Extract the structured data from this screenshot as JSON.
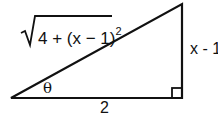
{
  "diagram": {
    "type": "right-triangle",
    "labels": {
      "hypotenuse_expr": "4 + (x − 1)",
      "hypotenuse_exponent": "2",
      "vertical_side": "x - 1",
      "base": "2",
      "angle": "θ"
    },
    "vertices": {
      "bottom_left": [
        11,
        99
      ],
      "top_right": [
        182,
        4
      ],
      "bottom_right": [
        182,
        99
      ]
    },
    "right_angle_marker": "bottom-right",
    "stroke_color": "#111111"
  }
}
